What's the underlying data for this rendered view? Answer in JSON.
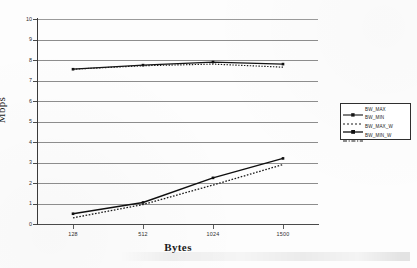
{
  "chart_data": {
    "type": "line",
    "title": "",
    "xlabel": "Bytes",
    "ylabel": "Mbps",
    "categories": [
      "128",
      "512",
      "1024",
      "1500"
    ],
    "ylim": [
      0,
      10
    ],
    "ytick_values": [
      "0",
      "1",
      "2",
      "3",
      "4",
      "5",
      "6",
      "7",
      "8",
      "9",
      "10"
    ],
    "grid": true,
    "legend_position": "right",
    "series": [
      {
        "name": "BW_MAX",
        "values": [
          7.55,
          7.75,
          7.9,
          7.8
        ],
        "style": "solid-marker"
      },
      {
        "name": "BW_MIN",
        "values": [
          7.55,
          7.72,
          7.8,
          7.65
        ],
        "style": "dotted"
      },
      {
        "name": "BW_MAX_W",
        "values": [
          0.5,
          1.05,
          2.25,
          3.2
        ],
        "style": "solid-marker"
      },
      {
        "name": "BW_MIN_W",
        "values": [
          0.3,
          0.95,
          1.9,
          2.9
        ],
        "style": "dash-dot"
      }
    ]
  },
  "axes": {
    "y_title": "Mbps",
    "x_title": "Bytes",
    "y_ticks": [
      "10",
      "9",
      "8",
      "7",
      "6",
      "5",
      "4",
      "3",
      "2",
      "1",
      "0"
    ],
    "x_ticks": [
      "128",
      "512",
      "1024",
      "1500"
    ]
  },
  "legend": {
    "entries": [
      {
        "label": "BW_MAX"
      },
      {
        "label": "BW_MIN"
      },
      {
        "label": "BW_MAX_W"
      },
      {
        "label": "BW_MIN_W"
      }
    ]
  },
  "colors": {
    "series_line": "#1a1a1a",
    "gridline": "#8d8d8d",
    "axis": "#3a3a3a",
    "text": "#1c1c1c",
    "background": "#fdfdfd"
  }
}
